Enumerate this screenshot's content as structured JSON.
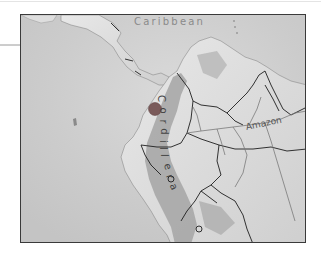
{
  "map": {
    "labels": {
      "sea": "Caribbean",
      "river": "Amazon",
      "mountain_range_letters": [
        "C",
        "o",
        "r",
        "d",
        "i",
        "l",
        "l",
        "e",
        "r",
        "a"
      ]
    },
    "marker": {
      "icon": "location-dot",
      "color": "#7a5a5a"
    },
    "colors": {
      "ocean": "#c9c9c9",
      "land": "#d8d8d8",
      "highland": "#9a9a9a",
      "border": "#1e1e1e",
      "frame": "#3a3a3a"
    }
  }
}
